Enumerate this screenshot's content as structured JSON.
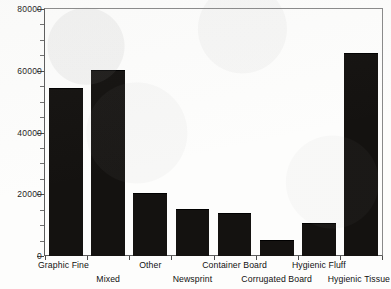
{
  "chart_data": {
    "type": "bar",
    "title": "",
    "subtitle": "",
    "xlabel": "",
    "ylabel": "",
    "categories": [
      "Graphic Fine",
      "Mixed",
      "Other",
      "Newsprint",
      "Container Board",
      "Corrugated Board",
      "Hygienic Fluff",
      "Hygienic Tissue"
    ],
    "values": [
      54000,
      60000,
      20000,
      15000,
      13500,
      5000,
      10500,
      65500
    ],
    "ylim": [
      0,
      80000
    ],
    "ytick_labels": [
      "0",
      "20000",
      "40000",
      "60000",
      "80000"
    ],
    "ytick_values": [
      0,
      20000,
      40000,
      60000,
      80000
    ],
    "yminor_step": 5000,
    "grid": false,
    "legend": null,
    "legend_position": "none",
    "bar_color": "#141210",
    "axis_color": "#5d5d5d",
    "background_color": "#fdfdfc",
    "label_rows": [
      "top",
      "bottom",
      "top",
      "bottom",
      "top",
      "bottom",
      "top",
      "bottom"
    ]
  }
}
